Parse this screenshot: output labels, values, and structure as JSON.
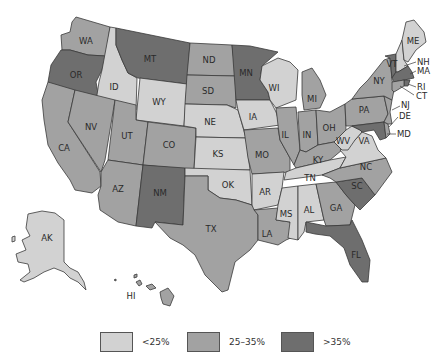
{
  "map": {
    "title": "",
    "colors": {
      "low": "#d2d2d2",
      "mid": "#a2a2a2",
      "high": "#6e6e6e"
    },
    "states": [
      {
        "abbr": "WA",
        "category": "mid"
      },
      {
        "abbr": "OR",
        "category": "high"
      },
      {
        "abbr": "CA",
        "category": "mid"
      },
      {
        "abbr": "ID",
        "category": "low"
      },
      {
        "abbr": "NV",
        "category": "mid"
      },
      {
        "abbr": "MT",
        "category": "high"
      },
      {
        "abbr": "WY",
        "category": "low"
      },
      {
        "abbr": "UT",
        "category": "mid"
      },
      {
        "abbr": "AZ",
        "category": "mid"
      },
      {
        "abbr": "CO",
        "category": "mid"
      },
      {
        "abbr": "NM",
        "category": "high"
      },
      {
        "abbr": "ND",
        "category": "mid"
      },
      {
        "abbr": "SD",
        "category": "mid"
      },
      {
        "abbr": "NE",
        "category": "low"
      },
      {
        "abbr": "KS",
        "category": "low"
      },
      {
        "abbr": "OK",
        "category": "low"
      },
      {
        "abbr": "TX",
        "category": "mid"
      },
      {
        "abbr": "MN",
        "category": "high"
      },
      {
        "abbr": "IA",
        "category": "low"
      },
      {
        "abbr": "MO",
        "category": "mid"
      },
      {
        "abbr": "AR",
        "category": "low"
      },
      {
        "abbr": "LA",
        "category": "mid"
      },
      {
        "abbr": "WI",
        "category": "low"
      },
      {
        "abbr": "IL",
        "category": "mid"
      },
      {
        "abbr": "MI",
        "category": "mid"
      },
      {
        "abbr": "IN",
        "category": "mid"
      },
      {
        "abbr": "OH",
        "category": "mid"
      },
      {
        "abbr": "KY",
        "category": "mid"
      },
      {
        "abbr": "TN",
        "category": "low"
      },
      {
        "abbr": "MS",
        "category": "low"
      },
      {
        "abbr": "AL",
        "category": "low"
      },
      {
        "abbr": "GA",
        "category": "mid"
      },
      {
        "abbr": "FL",
        "category": "high"
      },
      {
        "abbr": "SC",
        "category": "high"
      },
      {
        "abbr": "NC",
        "category": "mid"
      },
      {
        "abbr": "VA",
        "category": "low"
      },
      {
        "abbr": "WV",
        "category": "low"
      },
      {
        "abbr": "PA",
        "category": "mid"
      },
      {
        "abbr": "NY",
        "category": "mid"
      },
      {
        "abbr": "VT",
        "category": "high"
      },
      {
        "abbr": "NH",
        "category": "low"
      },
      {
        "abbr": "ME",
        "category": "low"
      },
      {
        "abbr": "MA",
        "category": "high"
      },
      {
        "abbr": "RI",
        "category": "high"
      },
      {
        "abbr": "CT",
        "category": "mid"
      },
      {
        "abbr": "NJ",
        "category": "mid"
      },
      {
        "abbr": "DE",
        "category": "mid"
      },
      {
        "abbr": "MD",
        "category": "high"
      },
      {
        "abbr": "AK",
        "category": "low"
      },
      {
        "abbr": "HI",
        "category": "mid"
      }
    ],
    "labels": {
      "WA": "WA",
      "OR": "OR",
      "CA": "CA",
      "ID": "ID",
      "NV": "NV",
      "MT": "MT",
      "WY": "WY",
      "UT": "UT",
      "AZ": "AZ",
      "CO": "CO",
      "NM": "NM",
      "ND": "ND",
      "SD": "SD",
      "NE": "NE",
      "KS": "KS",
      "OK": "OK",
      "TX": "TX",
      "MN": "MN",
      "IA": "IA",
      "MO": "MO",
      "AR": "AR",
      "LA": "LA",
      "WI": "WI",
      "IL": "IL",
      "MI": "MI",
      "IN": "IN",
      "OH": "OH",
      "KY": "KY",
      "TN": "TN",
      "MS": "MS",
      "AL": "AL",
      "GA": "GA",
      "FL": "FL",
      "SC": "SC",
      "NC": "NC",
      "VA": "VA",
      "WV": "WV",
      "PA": "PA",
      "NY": "NY",
      "VT": "VT",
      "NH": "NH",
      "ME": "ME",
      "MA": "MA",
      "RI": "RI",
      "CT": "CT",
      "NJ": "NJ",
      "DE": "DE",
      "MD": "MD",
      "AK": "AK",
      "HI": "HI"
    }
  },
  "legend": {
    "items": [
      {
        "label": "<25%",
        "category": "low",
        "color": "#d2d2d2"
      },
      {
        "label": "25–35%",
        "category": "mid",
        "color": "#a2a2a2"
      },
      {
        "label": ">35%",
        "category": "high",
        "color": "#6e6e6e"
      }
    ]
  }
}
